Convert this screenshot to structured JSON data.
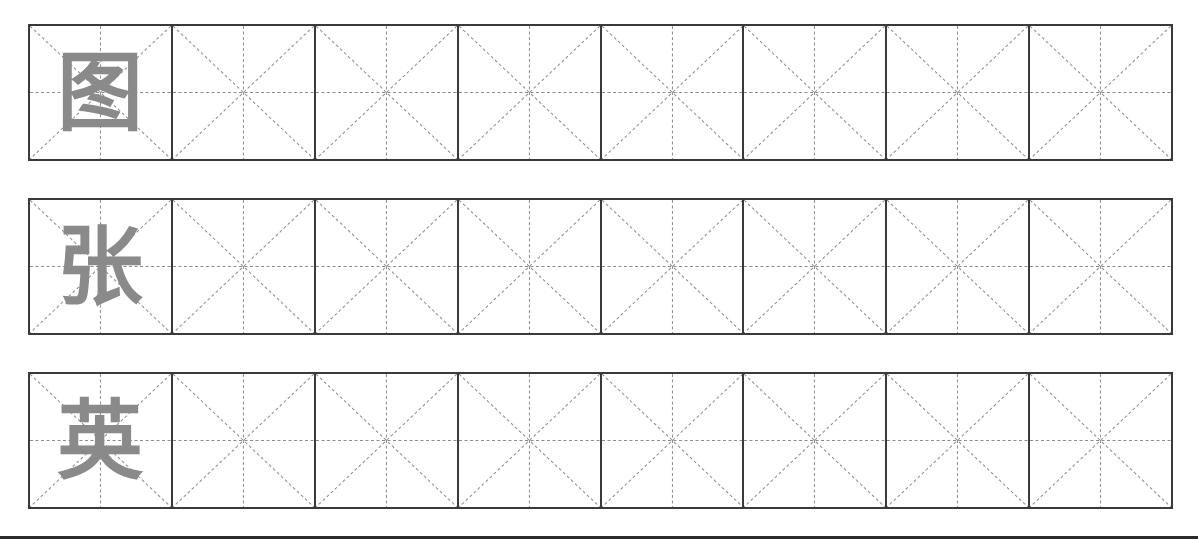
{
  "sheet": {
    "type": "mi-zi-ge practice grid",
    "columns_per_row": 8,
    "rows": [
      {
        "character": "图",
        "top": 24
      },
      {
        "character": "张",
        "top": 198
      },
      {
        "character": "英",
        "top": 372
      }
    ]
  },
  "colors": {
    "border": "#3a3a3a",
    "guide": "#8c8c8c",
    "character": "#8a8a8a",
    "bottom_rule": "#2b2b2b"
  }
}
